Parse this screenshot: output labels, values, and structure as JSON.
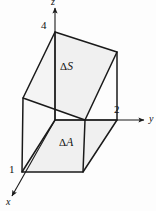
{
  "figure": {
    "name": "differential-volume-element",
    "background_color": "#fdfdfd",
    "stroke_color": "#1a1a1a",
    "face_fill_color": "#efefef"
  },
  "axes": [
    {
      "id": "z",
      "label": "z",
      "orientation": "vertical-up"
    },
    {
      "id": "y",
      "label": "y",
      "orientation": "horizontal-right"
    },
    {
      "id": "x",
      "label": "x",
      "orientation": "diagonal-down-left"
    }
  ],
  "vertex_labels": [
    {
      "id": "v4",
      "label": "4"
    },
    {
      "id": "v2",
      "label": "2"
    },
    {
      "id": "v1",
      "label": "1"
    }
  ],
  "face_labels": [
    {
      "id": "delta-s",
      "delta": "Δ",
      "symbol": "S"
    },
    {
      "id": "delta-a",
      "delta": "Δ",
      "symbol": "A"
    }
  ]
}
